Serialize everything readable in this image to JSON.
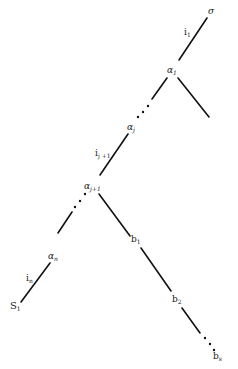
{
  "diagram": {
    "type": "tree",
    "nodes": {
      "root": {
        "base": "σ",
        "sub": ""
      },
      "alpha_1": {
        "base": "α",
        "sub": "1"
      },
      "alpha_j": {
        "base": "α",
        "sub": "j"
      },
      "alpha_j1": {
        "base": "α",
        "sub": "j+1"
      },
      "alpha_n": {
        "base": "α",
        "sub": "n"
      },
      "s_1": {
        "base": "S",
        "sub": "1"
      },
      "b_1": {
        "base": "b",
        "sub": "1"
      },
      "b_2": {
        "base": "b",
        "sub": "2"
      },
      "b_s": {
        "base": "b",
        "sub": "s"
      }
    },
    "edge_labels": {
      "i_1": {
        "base": "i",
        "sub": "1"
      },
      "i_j1": {
        "base": "i",
        "sub": "j +1"
      },
      "i_n": {
        "base": "i",
        "sub": "n"
      }
    },
    "caption_partial": ""
  }
}
